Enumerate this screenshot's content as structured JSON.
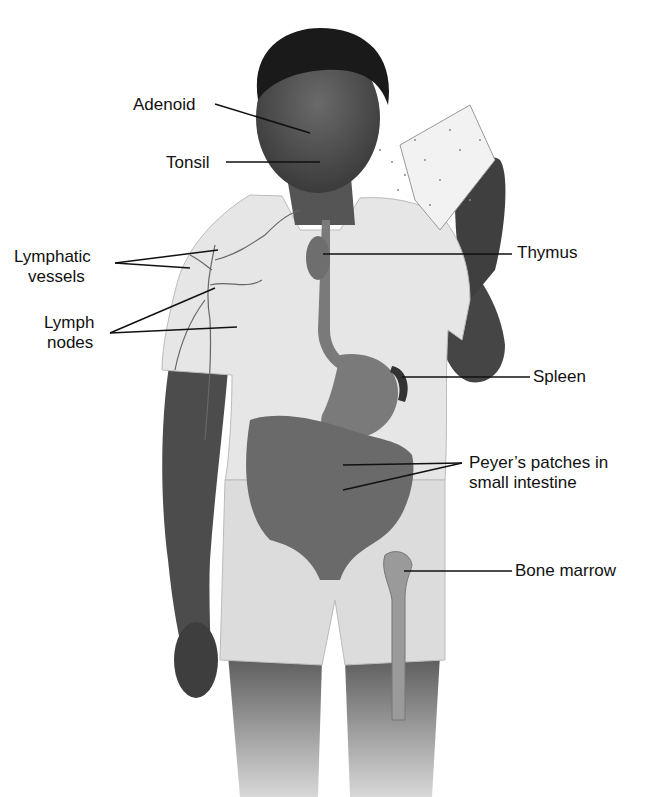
{
  "diagram": {
    "labels": [
      {
        "id": "adenoid",
        "text": "Adenoid"
      },
      {
        "id": "tonsil",
        "text": "Tonsil"
      },
      {
        "id": "lymphatic_vessels",
        "line1": "Lymphatic",
        "line2": "vessels"
      },
      {
        "id": "lymph_nodes",
        "line1": "Lymph",
        "line2": "nodes"
      },
      {
        "id": "thymus",
        "text": "Thymus"
      },
      {
        "id": "spleen",
        "text": "Spleen"
      },
      {
        "id": "peyers_patches",
        "line1": "Peyer’s patches in",
        "line2": "small intestine"
      },
      {
        "id": "bone_marrow",
        "text": "Bone marrow"
      }
    ],
    "colors": {
      "background": "#ffffff",
      "skin": "#4a4a4a",
      "shirt": "#e8e8e8",
      "organs": "#7a7a7a",
      "leader_line": "#111111"
    }
  }
}
